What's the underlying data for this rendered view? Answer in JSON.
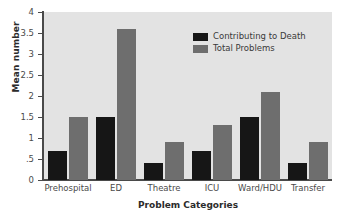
{
  "chart_data": {
    "type": "bar",
    "title": "",
    "xlabel": "Problem Categories",
    "ylabel": "Mean number",
    "categories": [
      "Prehospital",
      "ED",
      "Theatre",
      "ICU",
      "Ward/HDU",
      "Transfer"
    ],
    "series": [
      {
        "name": "Contributing to Death",
        "color": "#161616",
        "values": [
          0.7,
          1.5,
          0.4,
          0.7,
          1.5,
          0.4
        ]
      },
      {
        "name": "Total Problems",
        "color": "#6e6e6e",
        "values": [
          1.5,
          3.6,
          0.9,
          1.3,
          2.1,
          0.9
        ]
      }
    ],
    "ylim": [
      0,
      4
    ],
    "yticks": [
      0,
      0.5,
      1,
      1.5,
      2,
      2.5,
      3,
      3.5,
      4
    ],
    "ytick_labels": [
      "0",
      ".5",
      "1",
      "1.5",
      "2",
      "2.5",
      "3",
      "3.5",
      "4"
    ],
    "grid": false,
    "legend_position": "top-right",
    "plot_background": "#e3e3e3",
    "axis_color": "#4a4a4a"
  }
}
